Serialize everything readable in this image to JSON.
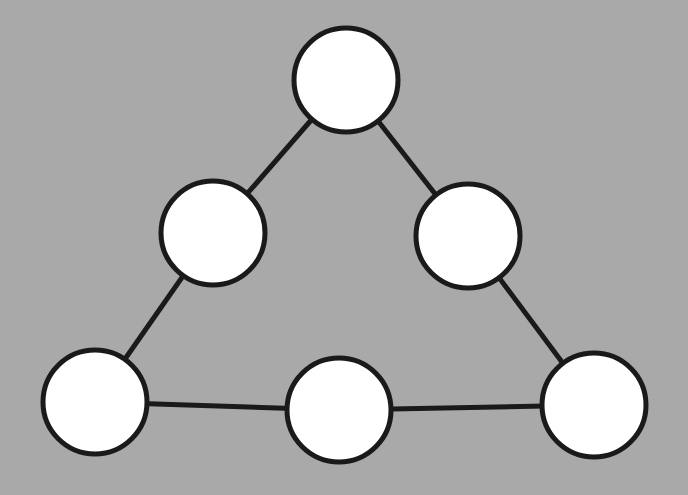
{
  "diagram": {
    "type": "triangle-node-graph",
    "background": "#a9a9a9",
    "node_fill": "#ffffff",
    "stroke_color": "#1a1a1a",
    "stroke_width": 5,
    "node_radius": 52,
    "nodes": [
      {
        "id": "top",
        "x": 346,
        "y": 80,
        "label": ""
      },
      {
        "id": "mid-left",
        "x": 213,
        "y": 233,
        "label": ""
      },
      {
        "id": "mid-right",
        "x": 468,
        "y": 236,
        "label": ""
      },
      {
        "id": "bottom-left",
        "x": 95,
        "y": 402,
        "label": ""
      },
      {
        "id": "bottom-middle",
        "x": 339,
        "y": 410,
        "label": ""
      },
      {
        "id": "bottom-right",
        "x": 594,
        "y": 405,
        "label": ""
      }
    ],
    "edges": [
      [
        "top",
        "mid-left"
      ],
      [
        "top",
        "mid-right"
      ],
      [
        "mid-left",
        "bottom-left"
      ],
      [
        "mid-right",
        "bottom-right"
      ],
      [
        "bottom-left",
        "bottom-middle"
      ],
      [
        "bottom-middle",
        "bottom-right"
      ]
    ]
  }
}
